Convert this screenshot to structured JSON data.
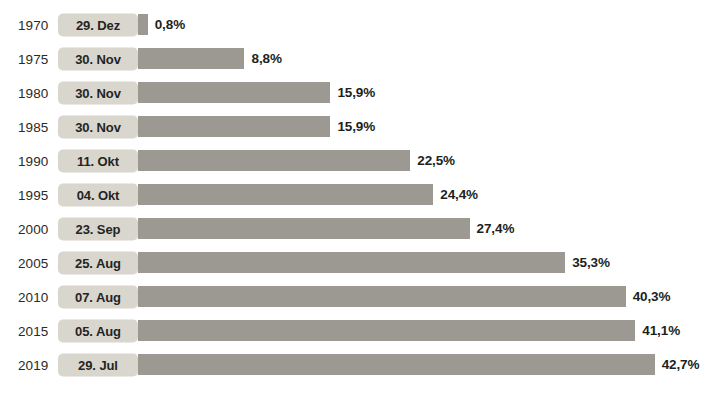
{
  "chart_data": {
    "type": "bar",
    "orientation": "horizontal",
    "title": "",
    "subtitle": "",
    "xlabel": "",
    "ylabel": "",
    "grid": false,
    "legend": null,
    "xlim": [
      0,
      42.7
    ],
    "categories": [
      "1970",
      "1975",
      "1980",
      "1985",
      "1990",
      "1995",
      "2000",
      "2005",
      "2010",
      "2015",
      "2019"
    ],
    "values": [
      0.8,
      8.8,
      15.9,
      15.9,
      22.5,
      24.4,
      27.4,
      35.3,
      40.3,
      41.1,
      42.7
    ],
    "value_labels": [
      "0,8%",
      "8,8%",
      "15,9%",
      "15,9%",
      "22,5%",
      "24,4%",
      "27,4%",
      "35,3%",
      "40,3%",
      "41,1%",
      "42,7%"
    ],
    "annotations": [
      "29. Dez",
      "30. Nov",
      "30. Nov",
      "30. Nov",
      "11. Okt",
      "04. Okt",
      "23. Sep",
      "25. Aug",
      "07. Aug",
      "05. Aug",
      "29. Jul"
    ],
    "colors": {
      "bar": "#9c9993",
      "pill": "#d9d6ce",
      "text": "#211f1d",
      "background": "#ffffff"
    },
    "rows": [
      {
        "year": "1970",
        "date": "29. Dez",
        "value": 0.8,
        "label": "0,8%"
      },
      {
        "year": "1975",
        "date": "30. Nov",
        "value": 8.8,
        "label": "8,8%"
      },
      {
        "year": "1980",
        "date": "30. Nov",
        "value": 15.9,
        "label": "15,9%"
      },
      {
        "year": "1985",
        "date": "30. Nov",
        "value": 15.9,
        "label": "15,9%"
      },
      {
        "year": "1990",
        "date": "11. Okt",
        "value": 22.5,
        "label": "22,5%"
      },
      {
        "year": "1995",
        "date": "04. Okt",
        "value": 24.4,
        "label": "24,4%"
      },
      {
        "year": "2000",
        "date": "23. Sep",
        "value": 27.4,
        "label": "27,4%"
      },
      {
        "year": "2005",
        "date": "25. Aug",
        "value": 35.3,
        "label": "35,3%"
      },
      {
        "year": "2010",
        "date": "07. Aug",
        "value": 40.3,
        "label": "40,3%"
      },
      {
        "year": "2015",
        "date": "05. Aug",
        "value": 41.1,
        "label": "41,1%"
      },
      {
        "year": "2019",
        "date": "29. Jul",
        "value": 42.7,
        "label": "42,7%"
      }
    ],
    "scale": {
      "px_per_percent": 12.1,
      "bar_origin_px": 138
    }
  }
}
